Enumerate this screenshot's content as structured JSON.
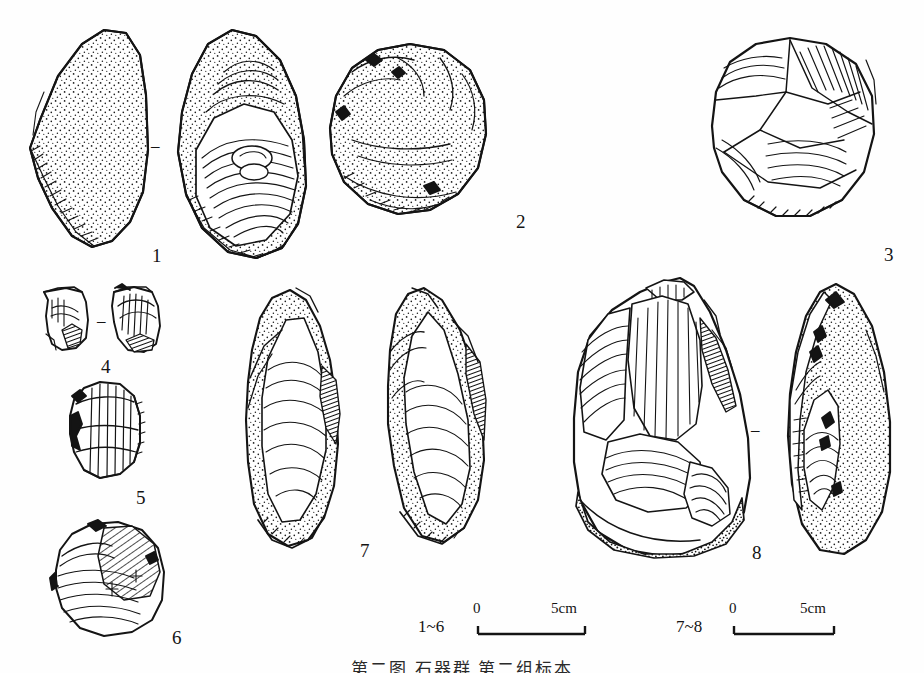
{
  "plate": {
    "type": "archaeological-lithic-illustration",
    "background_color": "#fefefe",
    "ink_color": "#141414",
    "artifacts": [
      {
        "number": "1",
        "label_x": 152,
        "label_y": 246,
        "views": 2,
        "description": "large flake with cortex, two views"
      },
      {
        "number": "2",
        "label_x": 516,
        "label_y": 212,
        "views": 1,
        "description": "rounded cortical core"
      },
      {
        "number": "3",
        "label_x": 884,
        "label_y": 245,
        "views": 1,
        "description": "discoidal core"
      },
      {
        "number": "4",
        "label_x": 101,
        "label_y": 357,
        "views": 2,
        "description": "small bladelet core, two views"
      },
      {
        "number": "5",
        "label_x": 136,
        "label_y": 488,
        "views": 1,
        "description": "small retouched scraper"
      },
      {
        "number": "6",
        "label_x": 172,
        "label_y": 628,
        "views": 1,
        "description": "small core fragment"
      },
      {
        "number": "7",
        "label_x": 360,
        "label_y": 541,
        "views": 2,
        "description": "elongated flake, two views"
      },
      {
        "number": "8",
        "label_x": 752,
        "label_y": 543,
        "views": 2,
        "description": "large handaxe, two views"
      }
    ],
    "separators": [
      {
        "for": "1",
        "x": 155,
        "y": 143
      },
      {
        "for": "4",
        "x": 101,
        "y": 318
      },
      {
        "for": "8",
        "x": 755,
        "y": 427
      }
    ],
    "scales": [
      {
        "range_label": "1~6",
        "zero_label": "0",
        "max_label": "5cm",
        "range_x": 418,
        "range_y": 618,
        "bar_x": 478,
        "bar_y": 627,
        "bar_width": 107
      },
      {
        "range_label": "7~8",
        "zero_label": "0",
        "max_label": "5cm",
        "range_x": 676,
        "range_y": 618,
        "bar_x": 734,
        "bar_y": 627,
        "bar_width": 100
      }
    ],
    "clipped_text": {
      "top": "···················",
      "bottom": "第二图 石器群 第二组标本"
    }
  }
}
